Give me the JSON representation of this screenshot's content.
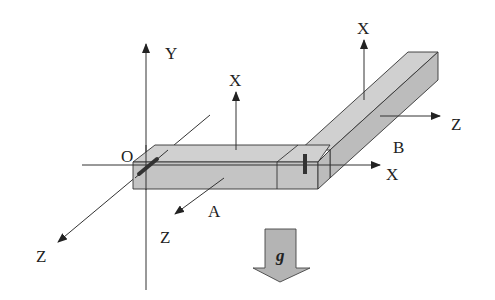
{
  "diagram": {
    "global_axes": {
      "origin_label": "O",
      "y_label": "Y",
      "x_label": "X",
      "z_label": "Z"
    },
    "beam_a": {
      "label": "A",
      "local_x_label": "X",
      "local_z_label": "Z"
    },
    "beam_b": {
      "label": "B",
      "local_x_label": "X",
      "local_z_label": "Z"
    },
    "gravity": {
      "label": "g"
    },
    "colors": {
      "beam_fill": "#c8c8c8",
      "beam_top": "#d2d2d2",
      "beam_side": "#bdbdbd",
      "line": "#333333",
      "joint_marker": "#333333",
      "gravity_fill": "#b4b4b4"
    }
  }
}
